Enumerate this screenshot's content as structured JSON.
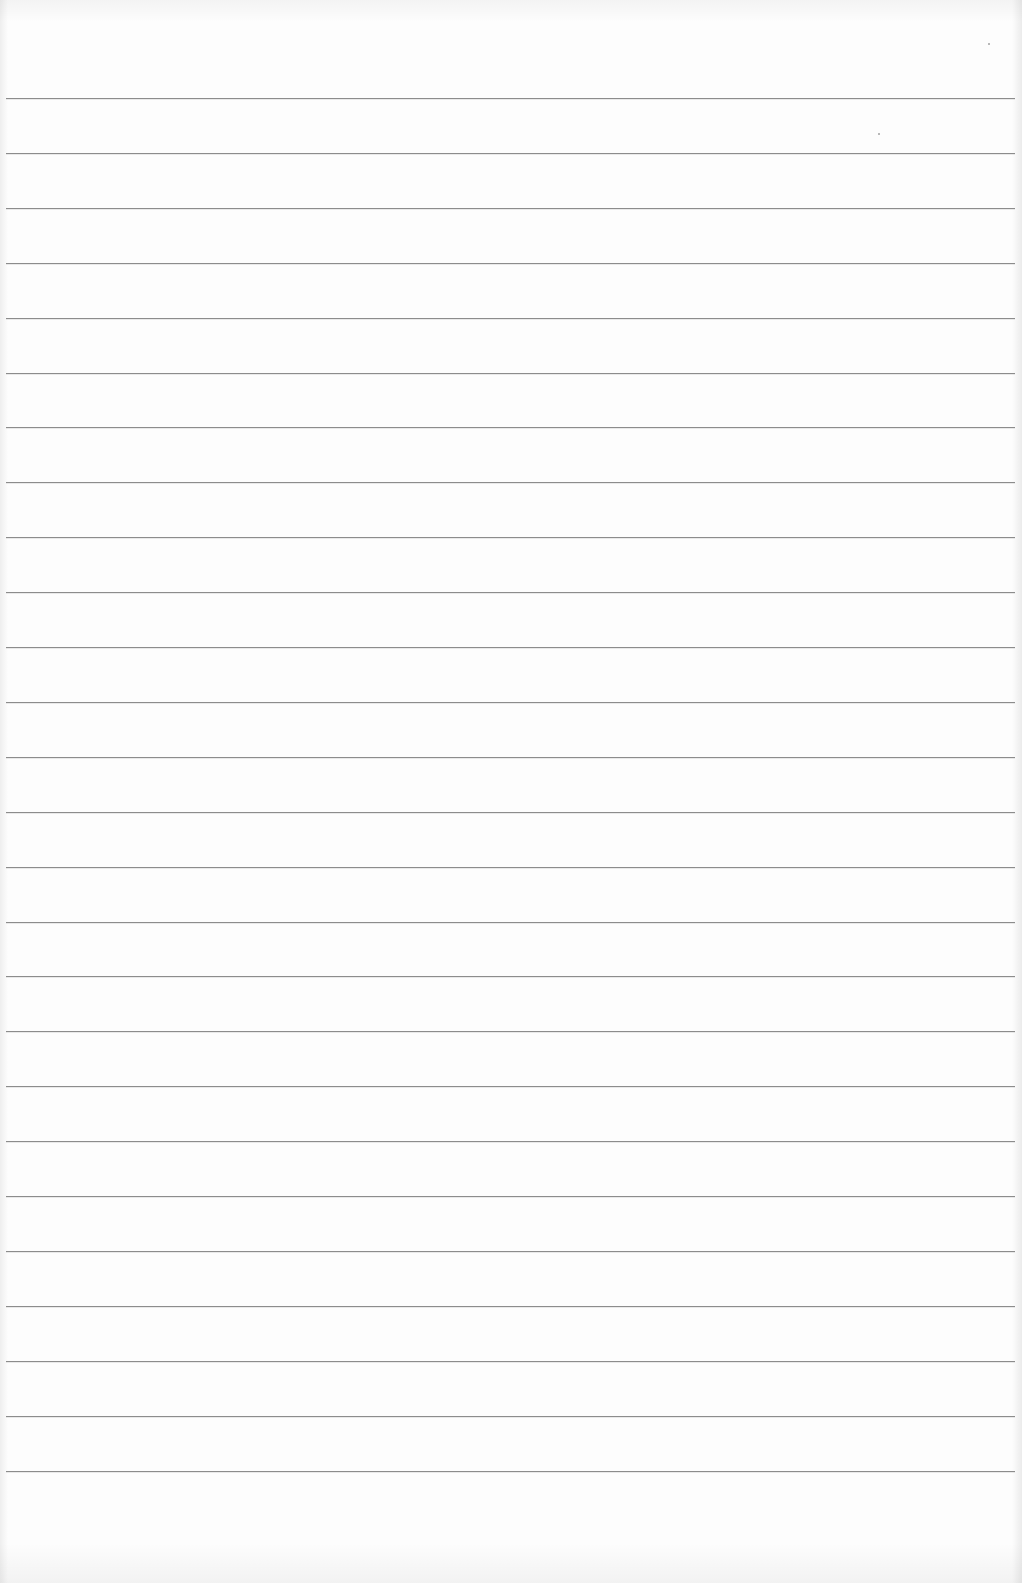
{
  "page": {
    "type": "blank ruled notebook paper",
    "background_color": "#fdfdfd",
    "line_color": "#8c8c8c",
    "line_count": 26,
    "first_line_y": 98,
    "line_spacing": 54.9,
    "line_left": 6,
    "line_right": 1015
  }
}
